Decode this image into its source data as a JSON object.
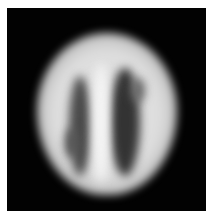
{
  "image": {
    "description": "Grayscale axial brain scan on black background",
    "colors": {
      "background": "#020202",
      "border": "#ffffff",
      "tissue": "#e0e0e0",
      "shadow": "#333333"
    }
  }
}
